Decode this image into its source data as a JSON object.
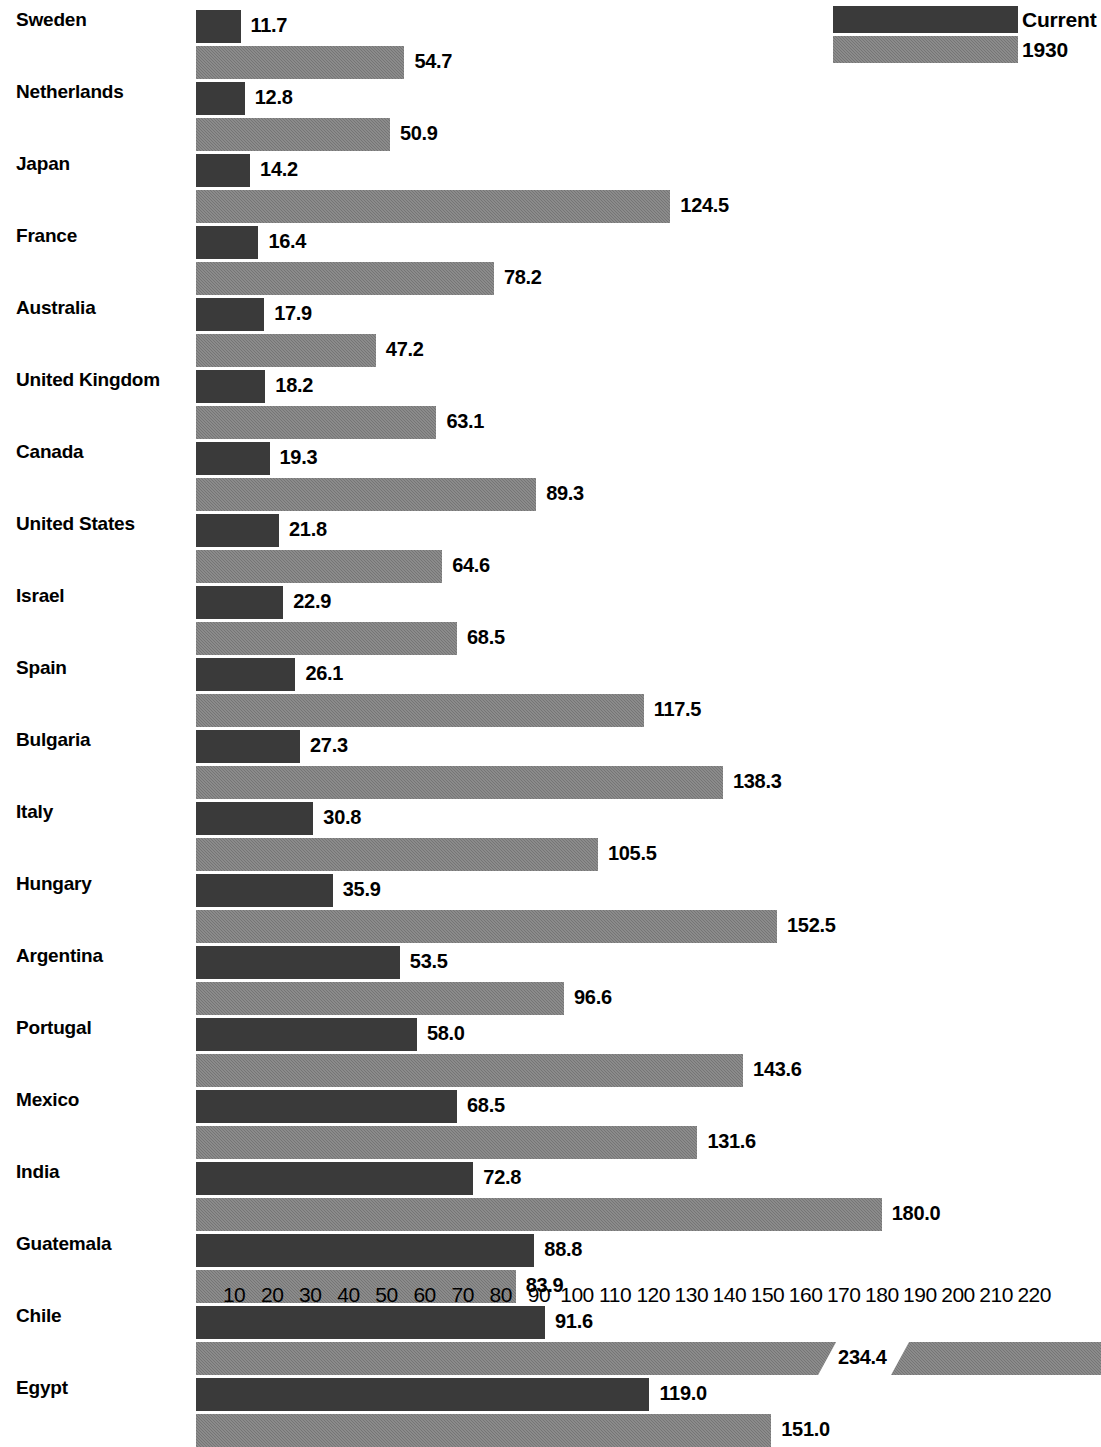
{
  "chart_data": {
    "type": "bar",
    "orientation": "horizontal",
    "title": "",
    "subtitle": "",
    "xlabel": "",
    "ylabel": "",
    "grid": false,
    "legend_position": "top-right",
    "xlim": [
      0,
      220
    ],
    "xticks": [
      10,
      20,
      30,
      40,
      50,
      60,
      70,
      80,
      90,
      100,
      110,
      120,
      130,
      140,
      150,
      160,
      170,
      180,
      190,
      200,
      210,
      220
    ],
    "axis_break": {
      "present": true,
      "series": "1930",
      "category": "Chile",
      "note": "bar is clipped with a diagonal break; value label sits inside the gap"
    },
    "categories": [
      "Sweden",
      "Netherlands",
      "Japan",
      "France",
      "Australia",
      "United  Kingdom",
      "Canada",
      "United States",
      "Israel",
      "Spain",
      "Bulgaria",
      "Italy",
      "Hungary",
      "Argentina",
      "Portugal",
      "Mexico",
      "India",
      "Guatemala",
      "Chile",
      "Egypt"
    ],
    "series": [
      {
        "name": "Current",
        "color": "#3a3a3a",
        "values": [
          11.7,
          12.8,
          14.2,
          16.4,
          17.9,
          18.2,
          19.3,
          21.8,
          22.9,
          26.1,
          27.3,
          30.8,
          35.9,
          53.5,
          58.0,
          68.5,
          72.8,
          88.8,
          91.6,
          119.0
        ],
        "labels": [
          "11.7",
          "12.8",
          "14.2",
          "16.4",
          "17.9",
          "18.2",
          "19.3",
          "21.8",
          "22.9",
          "26.1",
          "27.3",
          "30.8",
          "35.9",
          "53.5",
          "58.0",
          "68.5",
          "72.8",
          "88.8",
          "91.6",
          "119.0"
        ]
      },
      {
        "name": "1930",
        "color": "#757575",
        "values": [
          54.7,
          50.9,
          124.5,
          78.2,
          47.2,
          63.1,
          89.3,
          64.6,
          68.5,
          117.5,
          138.3,
          105.5,
          152.5,
          96.6,
          143.6,
          131.6,
          180.0,
          83.9,
          234.4,
          151.0
        ],
        "labels": [
          "54.7",
          "50.9",
          "124.5",
          "78.2",
          "47.2",
          "63.1",
          "89.3",
          "64.6",
          "68.5",
          "117.5",
          "138.3",
          "105.5",
          "152.5",
          "96.6",
          "143.6",
          "131.6",
          "180.0",
          "83.9",
          "234.4",
          "151.0"
        ]
      }
    ]
  },
  "legend": {
    "items": [
      {
        "label": "Current",
        "swatch": "current"
      },
      {
        "label": "1930",
        "swatch": "old"
      }
    ]
  }
}
